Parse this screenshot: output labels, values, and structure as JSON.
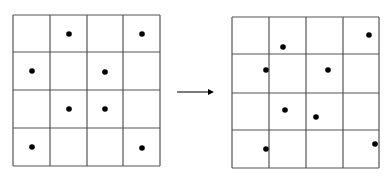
{
  "colors": {
    "line": "#555555",
    "dot": "#000000",
    "background": "#ffffff"
  },
  "left_grid": {
    "rows": 4,
    "cols": 4,
    "x_lines": [
      13,
      50,
      87,
      123,
      160
    ],
    "y_lines": [
      15,
      52,
      90,
      128,
      166
    ],
    "dots": [
      {
        "x": 69,
        "y": 34
      },
      {
        "x": 142,
        "y": 34
      },
      {
        "x": 32,
        "y": 71
      },
      {
        "x": 105,
        "y": 72
      },
      {
        "x": 69,
        "y": 109
      },
      {
        "x": 105,
        "y": 109
      },
      {
        "x": 32,
        "y": 147
      },
      {
        "x": 142,
        "y": 148
      }
    ]
  },
  "right_grid": {
    "rows": 4,
    "cols": 4,
    "x_lines": [
      232,
      269,
      306,
      343,
      379
    ],
    "y_lines": [
      17,
      54,
      93,
      130,
      168
    ],
    "dots": [
      {
        "x": 283,
        "y": 47
      },
      {
        "x": 369,
        "y": 35
      },
      {
        "x": 266,
        "y": 70
      },
      {
        "x": 328,
        "y": 70
      },
      {
        "x": 285,
        "y": 110
      },
      {
        "x": 316,
        "y": 117
      },
      {
        "x": 266,
        "y": 149
      },
      {
        "x": 375,
        "y": 144
      }
    ]
  },
  "arrow": {
    "x1": 177,
    "y1": 92,
    "x2": 214,
    "y2": 92,
    "icon": "right-arrow-icon"
  }
}
